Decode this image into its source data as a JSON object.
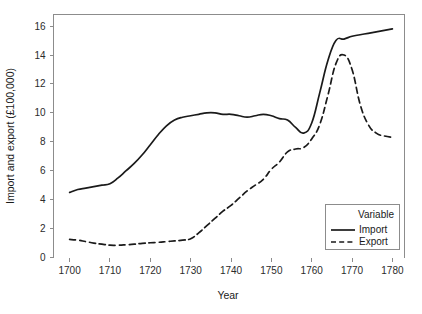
{
  "chart_data": {
    "type": "line",
    "title": "",
    "xlabel": "Year",
    "ylabel": "Import and export (£100,000)",
    "xlim": [
      1696,
      1783
    ],
    "ylim": [
      0,
      16.8
    ],
    "xticks": [
      1700,
      1710,
      1720,
      1730,
      1740,
      1750,
      1760,
      1770,
      1780
    ],
    "yticks": [
      0,
      2,
      4,
      6,
      8,
      10,
      12,
      14,
      16
    ],
    "grid": false,
    "legend": {
      "position": "bottom-right",
      "title": "Variable",
      "entries": [
        {
          "name": "Import",
          "style": "solid"
        },
        {
          "name": "Export",
          "style": "dashed"
        }
      ]
    },
    "x": [
      1700,
      1702,
      1704,
      1706,
      1708,
      1710,
      1712,
      1714,
      1716,
      1718,
      1720,
      1722,
      1724,
      1726,
      1728,
      1730,
      1732,
      1734,
      1736,
      1738,
      1740,
      1742,
      1744,
      1746,
      1748,
      1750,
      1752,
      1754,
      1756,
      1758,
      1760,
      1762,
      1764,
      1766,
      1768,
      1770,
      1772,
      1774,
      1776,
      1778,
      1780
    ],
    "series": [
      {
        "name": "Import",
        "style": "solid",
        "values": [
          4.5,
          4.7,
          4.8,
          4.9,
          5.0,
          5.1,
          5.5,
          6.0,
          6.5,
          7.1,
          7.8,
          8.5,
          9.1,
          9.5,
          9.7,
          9.8,
          9.9,
          10.0,
          10.0,
          9.9,
          9.9,
          9.8,
          9.7,
          9.8,
          9.9,
          9.8,
          9.6,
          9.5,
          9.0,
          8.6,
          9.3,
          11.4,
          13.6,
          15.0,
          15.1,
          15.3,
          15.4,
          15.5,
          15.6,
          15.7,
          15.8
        ]
      },
      {
        "name": "Export",
        "style": "dashed",
        "values": [
          1.25,
          1.2,
          1.1,
          1.0,
          0.92,
          0.85,
          0.85,
          0.88,
          0.92,
          0.98,
          1.02,
          1.05,
          1.1,
          1.15,
          1.2,
          1.3,
          1.7,
          2.2,
          2.7,
          3.2,
          3.6,
          4.1,
          4.6,
          5.0,
          5.4,
          6.1,
          6.6,
          7.3,
          7.5,
          7.6,
          8.2,
          9.2,
          11.2,
          13.4,
          14.0,
          13.0,
          10.6,
          9.2,
          8.6,
          8.4,
          8.3
        ]
      }
    ]
  }
}
